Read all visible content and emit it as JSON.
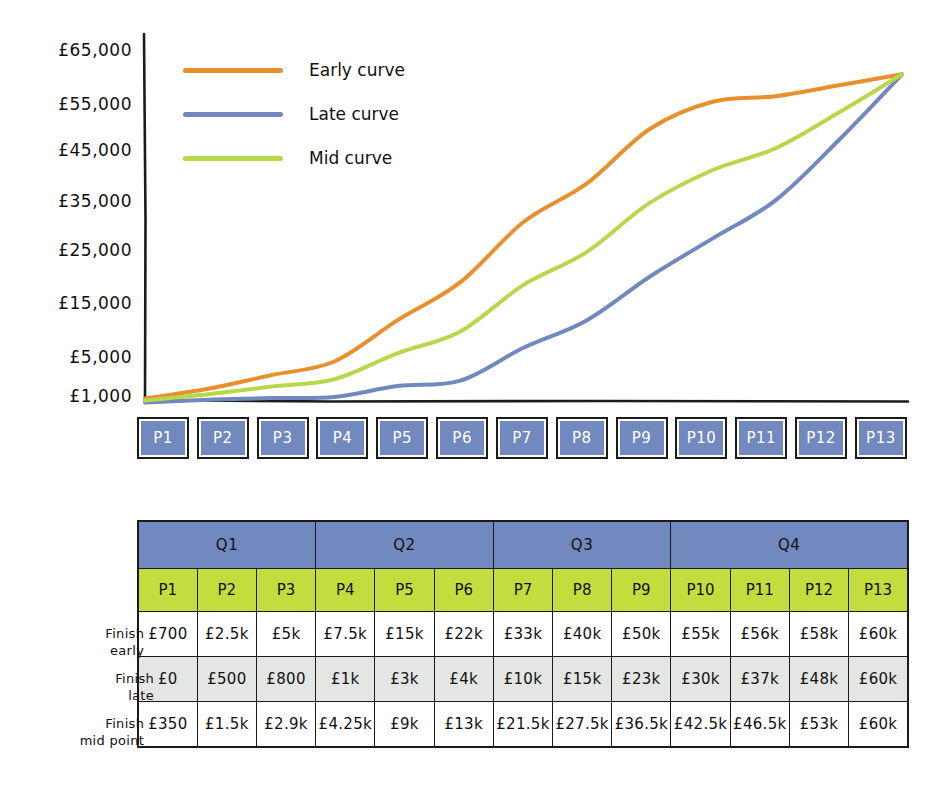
{
  "chart_data": {
    "type": "line",
    "title": "",
    "xlabel": "",
    "ylabel": "",
    "categories": [
      "P1",
      "P2",
      "P3",
      "P4",
      "P5",
      "P6",
      "P7",
      "P8",
      "P9",
      "P10",
      "P11",
      "P12",
      "P13"
    ],
    "y_ticks": [
      "£65,000",
      "£55,000",
      "£45,000",
      "£35,000",
      "£25,000",
      "£15,000",
      "£5,000",
      "£1,000"
    ],
    "y_tick_values": [
      65000,
      55000,
      45000,
      35000,
      25000,
      15000,
      5000,
      1000
    ],
    "ylim": [
      0,
      65000
    ],
    "grid": false,
    "legend_position": "top-left",
    "series": [
      {
        "name": "Early curve",
        "color": "#e8902e",
        "values": [
          700,
          2500,
          5000,
          7500,
          15000,
          22000,
          33000,
          40000,
          50000,
          55000,
          56000,
          58000,
          60000
        ],
        "labels": [
          "£700",
          "£2.5k",
          "£5k",
          "£7.5k",
          "£15k",
          "£22k",
          "£33k",
          "£40k",
          "£50k",
          "£55k",
          "£56k",
          "£58k",
          "£60k"
        ]
      },
      {
        "name": "Late curve",
        "color": "#7189be",
        "values": [
          0,
          500,
          800,
          1000,
          3000,
          4000,
          10000,
          15000,
          23000,
          30000,
          37000,
          48000,
          60000
        ],
        "labels": [
          "£0",
          "£500",
          "£800",
          "£1k",
          "£3k",
          "£4k",
          "£10k",
          "£15k",
          "£23k",
          "£30k",
          "£37k",
          "£48k",
          "£60k"
        ]
      },
      {
        "name": "Mid curve",
        "color": "#b6d84a",
        "values": [
          350,
          1500,
          2900,
          4250,
          9000,
          13000,
          21500,
          27500,
          36500,
          42500,
          46500,
          53000,
          60000
        ],
        "labels": [
          "£350",
          "£1.5k",
          "£2.9k",
          "£4.25k",
          "£9k",
          "£13k",
          "£21.5k",
          "£27.5k",
          "£36.5k",
          "£42.5k",
          "£46.5k",
          "£53k",
          "£60k"
        ]
      }
    ]
  },
  "legend": {
    "items": [
      {
        "label": "Early curve",
        "color": "#e8902e"
      },
      {
        "label": "Late curve",
        "color": "#7189be"
      },
      {
        "label": "Mid curve",
        "color": "#b6d84a"
      }
    ]
  },
  "axis": {
    "y_labels": [
      "£65,000",
      "£55,000",
      "£45,000",
      "£35,000",
      "£25,000",
      "£15,000",
      "£5,000",
      "£1,000"
    ]
  },
  "period_boxes": [
    "P1",
    "P2",
    "P3",
    "P4",
    "P5",
    "P6",
    "P7",
    "P8",
    "P9",
    "P10",
    "P11",
    "P12",
    "P13"
  ],
  "table": {
    "quarters": [
      {
        "label": "Q1",
        "span": 3
      },
      {
        "label": "Q2",
        "span": 3
      },
      {
        "label": "Q3",
        "span": 3
      },
      {
        "label": "Q4",
        "span": 4
      }
    ],
    "period_headers": [
      "P1",
      "P2",
      "P3",
      "P4",
      "P5",
      "P6",
      "P7",
      "P8",
      "P9",
      "P10",
      "P11",
      "P12",
      "P13"
    ],
    "rows": [
      {
        "label_line1": "Finish",
        "label_line2": "early",
        "shade": "white",
        "cells": [
          "£700",
          "£2.5k",
          "£5k",
          "£7.5k",
          "£15k",
          "£22k",
          "£33k",
          "£40k",
          "£50k",
          "£55k",
          "£56k",
          "£58k",
          "£60k"
        ]
      },
      {
        "label_line1": "Finish",
        "label_line2": "late",
        "shade": "grey",
        "cells": [
          "£0",
          "£500",
          "£800",
          "£1k",
          "£3k",
          "£4k",
          "£10k",
          "£15k",
          "£23k",
          "£30k",
          "£37k",
          "£48k",
          "£60k"
        ]
      },
      {
        "label_line1": "Finish",
        "label_line2": "mid point",
        "shade": "white",
        "cells": [
          "£350",
          "£1.5k",
          "£2.9k",
          "£4.25k",
          "£9k",
          "£13k",
          "£21.5k",
          "£27.5k",
          "£36.5k",
          "£42.5k",
          "£46.5k",
          "£53k",
          "£60k"
        ]
      }
    ]
  },
  "colors": {
    "early": "#e8902e",
    "late": "#7189be",
    "mid": "#b6d84a",
    "header_blue": "#7189be",
    "header_green": "#c4dd3e",
    "row_grey": "#e4e6e3",
    "ink": "#1b1b1b"
  }
}
